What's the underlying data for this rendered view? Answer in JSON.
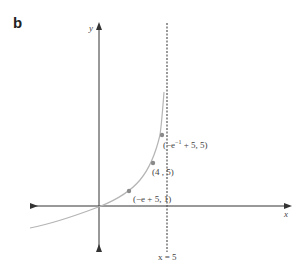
{
  "panel": {
    "label": "b"
  },
  "axes": {
    "x_label": "x",
    "y_label": "y"
  },
  "asymptote": {
    "label": "x = 5",
    "x_value": 5
  },
  "points": [
    {
      "label": "(−e⁻¹ + 5, 5)",
      "label_main": "(−e",
      "label_sup": "−1",
      "label_rest": " + 5, 5)"
    },
    {
      "label": "(4 , 5)"
    },
    {
      "label": "(−e + 5, 1)"
    }
  ],
  "colors": {
    "axis": "#333333",
    "curve": "#b5b5b5",
    "points": "#8a8a8a",
    "asymptote": "#555555"
  }
}
